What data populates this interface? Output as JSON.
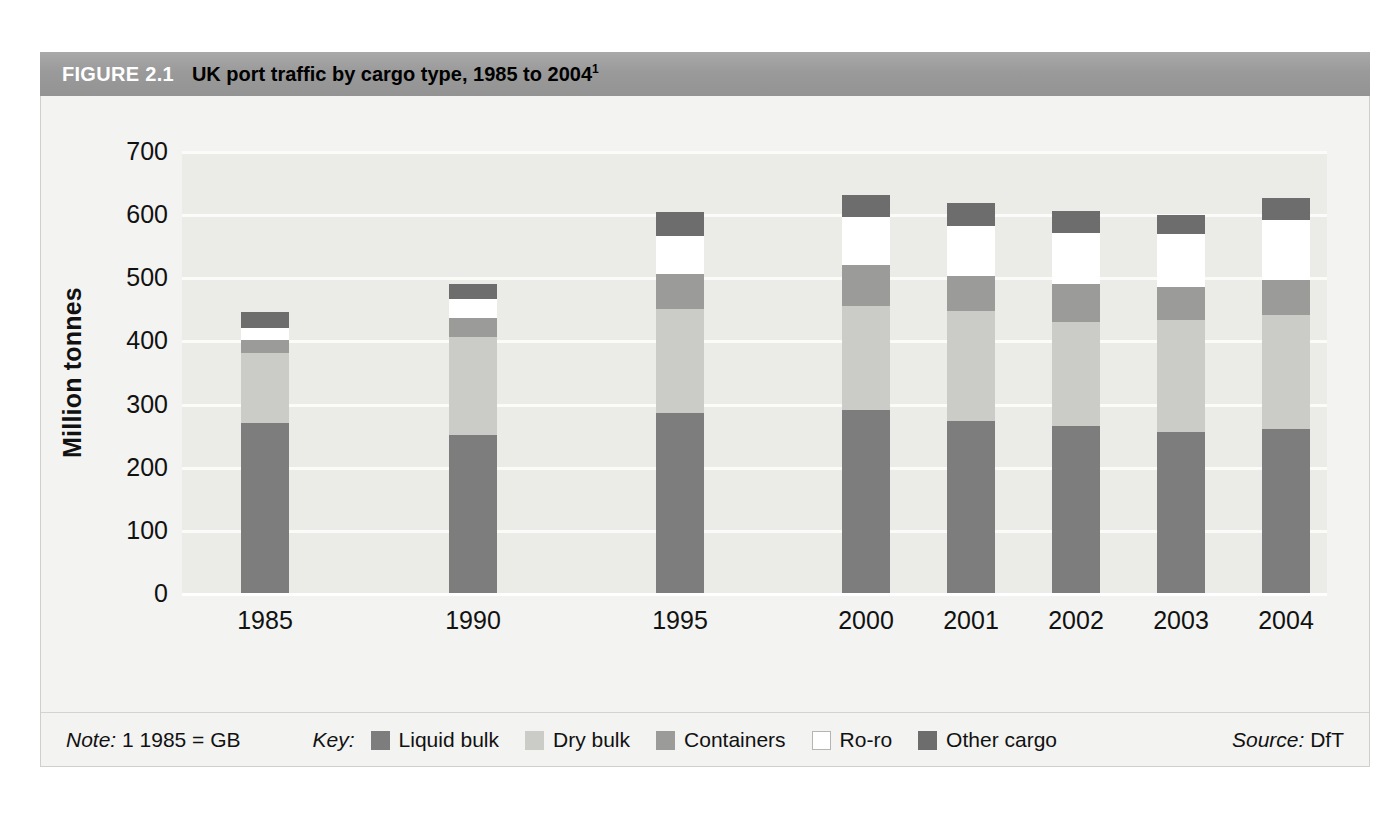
{
  "figure": {
    "number": "FIGURE 2.1",
    "title": "UK port traffic by cargo type, 1985 to 2004",
    "title_superscript": "1"
  },
  "footer": {
    "note_prefix": "Note:",
    "note_text": "1 1985 = GB",
    "key_label": "Key:",
    "source_prefix": "Source:",
    "source_text": "DfT"
  },
  "colors": {
    "liquid_bulk": "#7d7d7d",
    "dry_bulk": "#cbcbc8",
    "containers": "#9b9b99",
    "roro": "#ffffff",
    "other_cargo": "#6d6d6d",
    "header_band": "#9d9d9d",
    "plot_background": "#ebebe8",
    "figure_background": "#f3f3f1",
    "gridline": "#fbfbfa"
  },
  "chart_data": {
    "type": "bar",
    "subtype": "stacked",
    "title": "UK port traffic by cargo type, 1985 to 2004",
    "xlabel": "",
    "ylabel": "Million tonnes",
    "ylim": [
      0,
      700
    ],
    "yticks": [
      0,
      100,
      200,
      300,
      400,
      500,
      600,
      700
    ],
    "ytick_labels": [
      "0",
      "100",
      "200",
      "300",
      "400",
      "500",
      "600",
      "700"
    ],
    "grid": true,
    "grid_axis": "y",
    "legend_position": "bottom",
    "categories": [
      "1985",
      "1990",
      "1995",
      "2000",
      "2001",
      "2002",
      "2003",
      "2004"
    ],
    "series": [
      {
        "name": "Liquid bulk",
        "color": "#7d7d7d",
        "values": [
          270,
          250,
          285,
          290,
          272,
          265,
          255,
          260
        ]
      },
      {
        "name": "Dry bulk",
        "color": "#cbcbc8",
        "values": [
          110,
          155,
          165,
          165,
          175,
          165,
          177,
          180
        ]
      },
      {
        "name": "Containers",
        "color": "#9b9b99",
        "values": [
          20,
          30,
          55,
          65,
          55,
          60,
          52,
          55
        ]
      },
      {
        "name": "Ro-ro",
        "color": "#ffffff",
        "values": [
          20,
          30,
          60,
          75,
          80,
          80,
          85,
          95
        ]
      },
      {
        "name": "Other cargo",
        "color": "#6d6d6d",
        "values": [
          25,
          25,
          38,
          35,
          35,
          35,
          30,
          35
        ]
      }
    ],
    "totals": [
      445,
      490,
      543,
      570,
      557,
      555,
      549,
      565
    ],
    "note": "1 1985 = GB",
    "source": "DfT"
  }
}
